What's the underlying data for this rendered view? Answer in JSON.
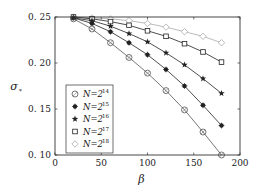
{
  "chart_data": {
    "type": "line",
    "title": "",
    "xlabel": "β",
    "ylabel": "σ*",
    "xlim": [
      0,
      200
    ],
    "ylim": [
      0.1,
      0.25
    ],
    "xticks": [
      0,
      50,
      100,
      150,
      200
    ],
    "yticks": [
      0.1,
      0.15,
      0.2,
      0.25
    ],
    "xtick_labels": [
      "0",
      "50",
      "100",
      "150",
      "200"
    ],
    "ytick_labels": [
      "0. 10",
      "0. 15",
      "0. 20",
      "0. 25"
    ],
    "grid": false,
    "legend_position": "lower left",
    "x": [
      20,
      40,
      60,
      80,
      100,
      120,
      140,
      160,
      180
    ],
    "series": [
      {
        "name": "N=2^14",
        "base": "N=2",
        "exp": "14",
        "marker": "circle-open",
        "color": "#555555",
        "values": [
          0.248,
          0.237,
          0.222,
          0.206,
          0.189,
          0.17,
          0.149,
          0.125,
          0.1
        ]
      },
      {
        "name": "N=2^15",
        "base": "N=2",
        "exp": "15",
        "marker": "filled-dot",
        "color": "#222222",
        "values": [
          0.249,
          0.243,
          0.234,
          0.222,
          0.209,
          0.193,
          0.175,
          0.154,
          0.132
        ]
      },
      {
        "name": "N=2^16",
        "base": "N=2",
        "exp": "16",
        "marker": "star",
        "color": "#222222",
        "values": [
          0.249,
          0.246,
          0.24,
          0.232,
          0.223,
          0.211,
          0.198,
          0.183,
          0.167
        ]
      },
      {
        "name": "N=2^17",
        "base": "N=2",
        "exp": "17",
        "marker": "square-open",
        "color": "#222222",
        "values": [
          0.25,
          0.248,
          0.245,
          0.241,
          0.235,
          0.229,
          0.221,
          0.212,
          0.201
        ]
      },
      {
        "name": "N=2^18",
        "base": "N=2",
        "exp": "18",
        "marker": "diamond-open",
        "color": "#aaaaaa",
        "values": [
          0.25,
          0.249,
          0.248,
          0.246,
          0.243,
          0.239,
          0.234,
          0.229,
          0.222
        ]
      }
    ]
  }
}
